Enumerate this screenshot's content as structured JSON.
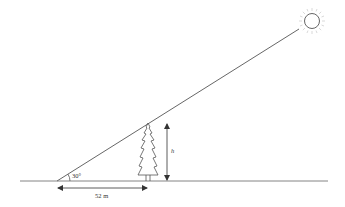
{
  "diagram": {
    "type": "trigonometry-word-problem",
    "labels": {
      "angle": "30°",
      "distance": "52 m",
      "height": "h"
    },
    "elements": {
      "sun": {
        "cx": 312,
        "cy": 21,
        "r": 7.5
      },
      "ground_line": {
        "x1": 20,
        "y1": 181,
        "x2": 328,
        "y2": 181
      },
      "sun_ray": {
        "x1": 57,
        "y1": 181,
        "x2": 299,
        "y2": 29
      },
      "tree": {
        "x": 148,
        "top_y": 123,
        "base_y": 181
      },
      "height_arrow": {
        "x": 167,
        "y1": 123,
        "y2": 181
      },
      "distance_arrow": {
        "y": 188,
        "x1": 57,
        "x2": 148
      }
    },
    "colors": {
      "line": "#555555",
      "sun": "#666666",
      "rays": "#cccccc",
      "background": "#ffffff"
    }
  }
}
